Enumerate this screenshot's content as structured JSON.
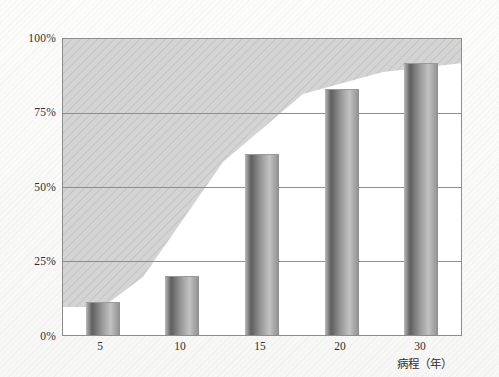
{
  "chart_data": {
    "type": "bar",
    "title": "",
    "subtitle": "",
    "xlabel": "病程（年）",
    "ylabel": "",
    "categories": [
      "5",
      "10",
      "15",
      "20",
      "30"
    ],
    "values": [
      11,
      20,
      61,
      83,
      92
    ],
    "value_unit": "%",
    "ylim": [
      0,
      100
    ],
    "ytick_labels": [
      "0%",
      "25%",
      "50%",
      "75%",
      "100%"
    ],
    "ytick_values": [
      0,
      25,
      50,
      75,
      100
    ],
    "grid": true,
    "legend": "none",
    "series": [
      {
        "name": "percentage",
        "values": [
          11,
          20,
          61,
          83,
          92
        ]
      }
    ],
    "annotations": {
      "shaded_area": "hatched grey band rising from lower-left to upper-right above the bar tops"
    }
  },
  "axis": {
    "y_ticks": [
      {
        "label": "100%",
        "value": 100
      },
      {
        "label": "75%",
        "value": 75
      },
      {
        "label": "50%",
        "value": 50
      },
      {
        "label": "25%",
        "value": 25
      },
      {
        "label": "0%",
        "value": 0
      }
    ],
    "x_ticks": [
      {
        "label": "5",
        "value": 5
      },
      {
        "label": "10",
        "value": 10
      },
      {
        "label": "15",
        "value": 15
      },
      {
        "label": "20",
        "value": 20
      },
      {
        "label": "30",
        "value": 30
      }
    ],
    "x_title": "病程（年）"
  },
  "bars": [
    {
      "category": "5",
      "value": 11
    },
    {
      "category": "10",
      "value": 20
    },
    {
      "category": "15",
      "value": 61
    },
    {
      "category": "20",
      "value": 83
    },
    {
      "category": "30",
      "value": 92
    }
  ],
  "caption": {
    "bottom_text": ""
  },
  "colors": {
    "page_background": "#fbfbfa",
    "plot_background": "#ffffff",
    "band_fill": "#d3d3d3",
    "axis_line": "#8d8d8d",
    "bar_dark": "#5f5f5f",
    "bar_light": "#c2c2c2",
    "text": "#2e2e2e"
  }
}
